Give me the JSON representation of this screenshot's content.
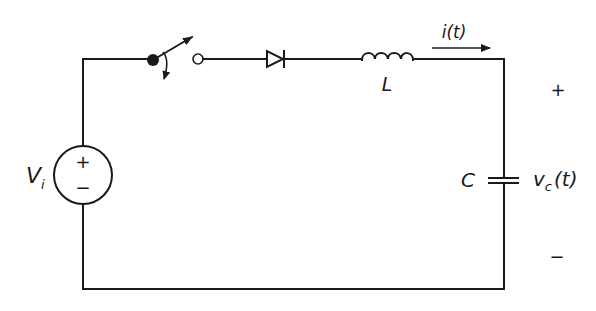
{
  "diagram": {
    "type": "circuit-schematic",
    "colors": {
      "stroke": "#1a1a1a",
      "background": "#ffffff"
    },
    "components": {
      "source": {
        "label": "V",
        "subscript": "i",
        "plus": "+",
        "minus": "−"
      },
      "switch": {
        "label": ""
      },
      "diode": {
        "label": ""
      },
      "inductor": {
        "label": "L"
      },
      "capacitor": {
        "label": "C"
      }
    },
    "annotations": {
      "current": {
        "label": "i(t)"
      },
      "capacitor_voltage": {
        "symbol": "v",
        "subscript": "c",
        "suffix": "(t)",
        "plus": "+",
        "minus": "−"
      }
    }
  }
}
